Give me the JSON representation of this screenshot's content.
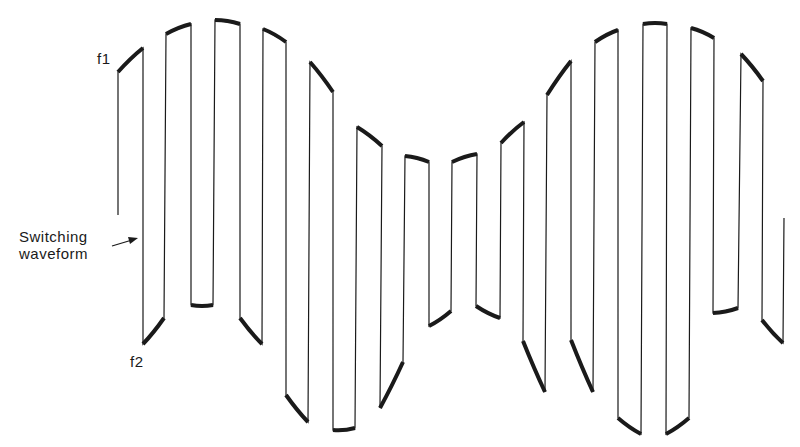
{
  "figure": {
    "labels": {
      "f1": "f1",
      "f2": "f2",
      "switching_line1": "Switching",
      "switching_line2": "waveform"
    },
    "colors": {
      "stroke": "#1a1a1a",
      "background": "#ffffff"
    },
    "segments": [
      {
        "x1": 118,
        "x2": 143,
        "level": "f1",
        "y1": 72,
        "y2": 48
      },
      {
        "x1": 143,
        "x2": 164,
        "level": "f2",
        "y1": 344,
        "y2": 318
      },
      {
        "x1": 166,
        "x2": 191,
        "level": "f1",
        "y1": 34,
        "y2": 24
      },
      {
        "x1": 191,
        "x2": 213,
        "level": "f2",
        "y1": 305,
        "y2": 305
      },
      {
        "x1": 215,
        "x2": 240,
        "level": "f1",
        "y1": 20,
        "y2": 24
      },
      {
        "x1": 240,
        "x2": 262,
        "level": "f2",
        "y1": 318,
        "y2": 344
      },
      {
        "x1": 263,
        "x2": 286,
        "level": "f1",
        "y1": 29,
        "y2": 42
      },
      {
        "x1": 286,
        "x2": 308,
        "level": "f2",
        "y1": 395,
        "y2": 422
      },
      {
        "x1": 310,
        "x2": 333,
        "level": "f1",
        "y1": 62,
        "y2": 92
      },
      {
        "x1": 333,
        "x2": 355,
        "level": "f2",
        "y1": 430,
        "y2": 428
      },
      {
        "x1": 357,
        "x2": 382,
        "level": "f1",
        "y1": 127,
        "y2": 146
      },
      {
        "x1": 380,
        "x2": 403,
        "level": "f2",
        "y1": 408,
        "y2": 362
      },
      {
        "x1": 405,
        "x2": 429,
        "level": "f1",
        "y1": 156,
        "y2": 162
      },
      {
        "x1": 429,
        "x2": 451,
        "level": "f2",
        "y1": 326,
        "y2": 311
      },
      {
        "x1": 452,
        "x2": 477,
        "level": "f1",
        "y1": 162,
        "y2": 154
      },
      {
        "x1": 476,
        "x2": 500,
        "level": "f2",
        "y1": 306,
        "y2": 318
      },
      {
        "x1": 501,
        "x2": 524,
        "level": "f1",
        "y1": 143,
        "y2": 122
      },
      {
        "x1": 523,
        "x2": 545,
        "level": "f2",
        "y1": 341,
        "y2": 392
      },
      {
        "x1": 547,
        "x2": 571,
        "level": "f1",
        "y1": 95,
        "y2": 61
      },
      {
        "x1": 571,
        "x2": 593,
        "level": "f2",
        "y1": 340,
        "y2": 392
      },
      {
        "x1": 595,
        "x2": 618,
        "level": "f1",
        "y1": 42,
        "y2": 30
      },
      {
        "x1": 618,
        "x2": 641,
        "level": "f2",
        "y1": 418,
        "y2": 434
      },
      {
        "x1": 643,
        "x2": 667,
        "level": "f1",
        "y1": 24,
        "y2": 24
      },
      {
        "x1": 666,
        "x2": 689,
        "level": "f2",
        "y1": 434,
        "y2": 418
      },
      {
        "x1": 691,
        "x2": 714,
        "level": "f1",
        "y1": 28,
        "y2": 38
      },
      {
        "x1": 713,
        "x2": 738,
        "level": "f2",
        "y1": 313,
        "y2": 308
      },
      {
        "x1": 741,
        "x2": 763,
        "level": "f1",
        "y1": 54,
        "y2": 81
      },
      {
        "x1": 762,
        "x2": 783,
        "level": "f2",
        "y1": 320,
        "y2": 343
      }
    ],
    "start": {
      "x": 118,
      "y": 215
    },
    "end": {
      "x": 784,
      "y": 218
    },
    "arrow": {
      "x1": 112,
      "y1": 246,
      "x2": 138,
      "y2": 238
    }
  }
}
